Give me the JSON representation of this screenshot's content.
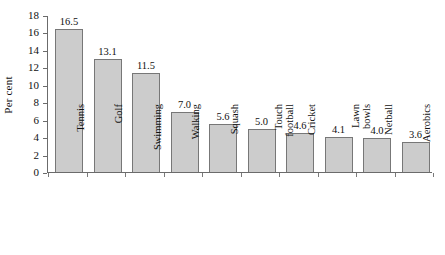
{
  "chart_data": {
    "type": "bar",
    "title": "",
    "xlabel": "",
    "ylabel": "Per cent",
    "ylim": [
      0,
      18
    ],
    "ytick_step": 2,
    "yticks": [
      "18",
      "16",
      "14",
      "12",
      "10",
      "8",
      "6",
      "4",
      "2",
      "0"
    ],
    "grid": false,
    "legend": false,
    "bar_color": "#cccccc",
    "bar_border_color": "#777777",
    "axis_color": "#6b6b6b",
    "background": "#ffffff",
    "categories": [
      "Tennis",
      "Golf",
      "Swimming",
      "Walking",
      "Squash",
      "Touch football",
      "Cricket",
      "Lawn bowls",
      "Netball",
      "Aerobics"
    ],
    "category_lines": [
      [
        "Tennis"
      ],
      [
        "Golf"
      ],
      [
        "Swimming"
      ],
      [
        "Walking"
      ],
      [
        "Squash"
      ],
      [
        "Touch",
        "football"
      ],
      [
        "Cricket"
      ],
      [
        "Lawn",
        "bowls"
      ],
      [
        "Netball"
      ],
      [
        "Aerobics"
      ]
    ],
    "values": [
      16.5,
      13.1,
      11.5,
      7.0,
      5.6,
      5.0,
      4.6,
      4.1,
      4.0,
      3.6
    ],
    "value_labels": [
      "16.5",
      "13.1",
      "11.5",
      "7.0",
      "5.6",
      "5.0",
      "4.6",
      "4.1",
      "4.0",
      "3.6"
    ]
  }
}
